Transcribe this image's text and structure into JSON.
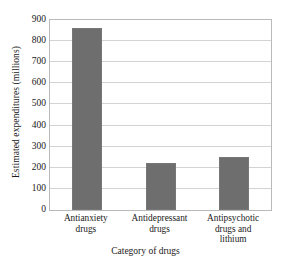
{
  "chart_data": {
    "type": "bar",
    "title": "",
    "categories": [
      "Antianxiety drugs",
      "Antidepressant drugs",
      "Antipsychotic drugs and lithium"
    ],
    "category_lines": [
      [
        "Antianxiety",
        "drugs"
      ],
      [
        "Antidepressant",
        "drugs"
      ],
      [
        "Antipsychotic",
        "drugs and",
        "lithium"
      ]
    ],
    "values": [
      860,
      225,
      250
    ],
    "xlabel": "Category of drugs",
    "ylabel": "Estimated expenditures (millions)",
    "ylim": [
      0,
      900
    ],
    "ytick_labels": [
      "900",
      "800",
      "700",
      "600",
      "500",
      "400",
      "300",
      "200",
      "100",
      "0"
    ],
    "ytick_values": [
      900,
      800,
      700,
      600,
      500,
      400,
      300,
      200,
      100,
      0
    ],
    "grid": true,
    "legend": false,
    "bar_color": "#6e6e6e",
    "grid_color": "#d3d3d3",
    "axis_color": "#b9b9b9",
    "text_color": "#1a1a1a"
  }
}
